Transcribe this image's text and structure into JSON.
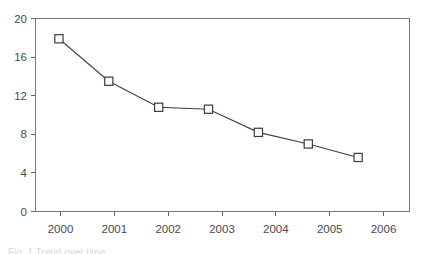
{
  "chart_data": {
    "type": "line",
    "title": "",
    "subtitle": "",
    "xlabel": "",
    "ylabel": "",
    "categories": [
      "2000",
      "2001",
      "2002",
      "2003",
      "2004",
      "2005",
      "2006"
    ],
    "values": [
      17.9,
      13.5,
      10.8,
      10.6,
      8.2,
      7.0,
      5.6
    ],
    "series": [
      {
        "name": "",
        "values": [
          17.9,
          13.5,
          10.8,
          10.6,
          8.2,
          7.0,
          5.6
        ]
      }
    ],
    "ylim": [
      0,
      20
    ],
    "y_ticks": [
      0,
      4,
      8,
      12,
      16,
      20
    ],
    "y_tick_labels": [
      "0",
      "4",
      "8",
      "12",
      "16",
      "20"
    ],
    "x_tick_labels": [
      "2000",
      "2001",
      "2002",
      "2003",
      "2004",
      "2005",
      "2006"
    ],
    "grid": false,
    "legend": "none",
    "marker": "open-square",
    "line_color": "#3b3b4a",
    "marker_fill": "#ffffff",
    "marker_edge_color": "#3b3b4a",
    "axis_color": "#666666",
    "background_color": "#ffffff",
    "annotations": []
  },
  "footer": {
    "artifact_text": "Fig. 1 Trend over time"
  }
}
